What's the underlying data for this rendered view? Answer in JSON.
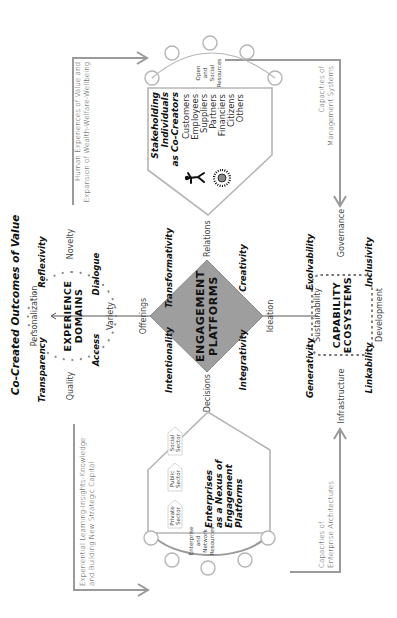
{
  "title": "Co-Created  Outcomes of Value",
  "experience_domains": {
    "label_line1": "EXPERIENCE",
    "label_line2": "DOMAINS",
    "axes": {
      "top": "Personalization",
      "bottom": "Variety",
      "left": "Quality",
      "right": "Novelty"
    },
    "qualities": {
      "top_left": "Transparency",
      "top_right": "Reflexivity",
      "bottom_left": "Access",
      "bottom_right": "Dialogue"
    }
  },
  "engagement_platforms": {
    "label_line1": "ENGAGEMENT",
    "label_line2": "PLATFORMS",
    "vertices": {
      "top": "Offerings",
      "bottom": "Ideation",
      "left": "Decisions",
      "right": "Relations"
    },
    "qualities": {
      "top_left": "Intentionality",
      "top_right": "Transformativity",
      "bottom_left": "Integrativity",
      "bottom_right": "Creativity"
    },
    "fill_color": "#9e9e9e"
  },
  "capability_ecosystems": {
    "label_line1": "CAPABILITY",
    "label_line2": "ECOSYSTEMS",
    "axes": {
      "top": "Sustainability",
      "bottom": "Development",
      "left": "Infrastructure",
      "right": "Governance"
    },
    "qualities": {
      "top_left": "Generativity",
      "top_right": "Evolvability",
      "bottom_left": "Linkability",
      "bottom_right": "Inclusivity"
    }
  },
  "enterprises": {
    "title_lines": [
      "Enterprises",
      "as a Nexus of",
      "Engagement",
      "Platforms"
    ],
    "sectors": [
      {
        "line1": "Private",
        "line2": "Sector"
      },
      {
        "line1": "Public",
        "line2": "Sector"
      },
      {
        "line1": "Social",
        "line2": "Sector"
      }
    ],
    "resources_lines": [
      "Enterprise",
      "and",
      "Network",
      "Resources"
    ]
  },
  "stakeholders": {
    "title_lines": [
      "Stakeholding",
      "Individuals",
      "as Co-Creators"
    ],
    "list": [
      "Customers",
      "Employees",
      "Suppliers",
      "Partners",
      "Financiers",
      "Citizens",
      "Others"
    ],
    "resources_lines": [
      "Open",
      "and",
      "Social",
      "Resources"
    ],
    "icons": [
      "person-figure-icon",
      "sun-burst-icon"
    ]
  },
  "flows": {
    "experiential": {
      "line1": "Experiential Learning-Insights-Knowledge",
      "line2": "and Building New Strategic Capital"
    },
    "human": {
      "line1": "Human Experiences of Value and",
      "line2": "Expansion of Wealth-Welfare-Wellbeing"
    },
    "enterprise_arch": {
      "line1": "Capacities of",
      "line2": "Enterprise Architectures"
    },
    "management": {
      "line1": "Capacities of",
      "line2": "Management Systems"
    }
  }
}
